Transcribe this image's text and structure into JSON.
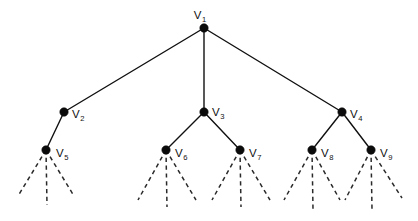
{
  "figure": {
    "kind": "rooted-tree-diagram",
    "title": "",
    "width": 418,
    "height": 221,
    "background_color": "#ffffff",
    "line_color": "#101010",
    "node_color": "#0b0b0b"
  },
  "chart_data": {
    "type": "diagram",
    "title": "",
    "xlabel": "",
    "ylabel": "",
    "nodes": [
      {
        "id": "V1",
        "label": "V",
        "subscript": "1",
        "x": 204,
        "y": 28,
        "label_x": 200,
        "label_y": 19,
        "label_anchor": "middle",
        "level": 0
      },
      {
        "id": "V2",
        "label": "V",
        "subscript": "2",
        "x": 64,
        "y": 112,
        "label_x": 72,
        "label_y": 118,
        "label_anchor": "start",
        "level": 1
      },
      {
        "id": "V3",
        "label": "V",
        "subscript": "3",
        "x": 204,
        "y": 112,
        "label_x": 212,
        "label_y": 116,
        "label_anchor": "start",
        "level": 1
      },
      {
        "id": "V4",
        "label": "V",
        "subscript": "4",
        "x": 342,
        "y": 112,
        "label_x": 350,
        "label_y": 118,
        "label_anchor": "start",
        "level": 1
      },
      {
        "id": "V5",
        "label": "V",
        "subscript": "5",
        "x": 46,
        "y": 150,
        "label_x": 56,
        "label_y": 157,
        "label_anchor": "start",
        "level": 2
      },
      {
        "id": "V6",
        "label": "V",
        "subscript": "6",
        "x": 166,
        "y": 150,
        "label_x": 175,
        "label_y": 157,
        "label_anchor": "start",
        "level": 2
      },
      {
        "id": "V7",
        "label": "V",
        "subscript": "7",
        "x": 240,
        "y": 150,
        "label_x": 249,
        "label_y": 157,
        "label_anchor": "start",
        "level": 2
      },
      {
        "id": "V8",
        "label": "V",
        "subscript": "8",
        "x": 312,
        "y": 150,
        "label_x": 321,
        "label_y": 157,
        "label_anchor": "start",
        "level": 2
      },
      {
        "id": "V9",
        "label": "V",
        "subscript": "9",
        "x": 371,
        "y": 150,
        "label_x": 380,
        "label_y": 157,
        "label_anchor": "start",
        "level": 2
      }
    ],
    "edges": [
      {
        "from": "V1",
        "to": "V2",
        "style": "solid"
      },
      {
        "from": "V1",
        "to": "V3",
        "style": "solid"
      },
      {
        "from": "V1",
        "to": "V4",
        "style": "solid"
      },
      {
        "from": "V2",
        "to": "V5",
        "style": "solid"
      },
      {
        "from": "V3",
        "to": "V6",
        "style": "solid"
      },
      {
        "from": "V3",
        "to": "V7",
        "style": "solid"
      },
      {
        "from": "V4",
        "to": "V8",
        "style": "solid"
      },
      {
        "from": "V4",
        "to": "V9",
        "style": "solid"
      }
    ],
    "dashed_stubs": [
      {
        "from": "V5",
        "x1": 46,
        "y1": 150,
        "x2": 18,
        "y2": 196
      },
      {
        "from": "V5",
        "x1": 46,
        "y1": 150,
        "x2": 47,
        "y2": 205
      },
      {
        "from": "V5",
        "x1": 46,
        "y1": 150,
        "x2": 74,
        "y2": 196
      },
      {
        "from": "V6",
        "x1": 166,
        "y1": 150,
        "x2": 138,
        "y2": 200
      },
      {
        "from": "V6",
        "x1": 166,
        "y1": 150,
        "x2": 167,
        "y2": 207
      },
      {
        "from": "V6",
        "x1": 166,
        "y1": 150,
        "x2": 196,
        "y2": 200
      },
      {
        "from": "V7",
        "x1": 240,
        "y1": 150,
        "x2": 212,
        "y2": 200
      },
      {
        "from": "V7",
        "x1": 240,
        "y1": 150,
        "x2": 241,
        "y2": 207
      },
      {
        "from": "V7",
        "x1": 240,
        "y1": 150,
        "x2": 270,
        "y2": 200
      },
      {
        "from": "V8",
        "x1": 312,
        "y1": 150,
        "x2": 284,
        "y2": 200
      },
      {
        "from": "V8",
        "x1": 312,
        "y1": 150,
        "x2": 313,
        "y2": 209
      },
      {
        "from": "V8",
        "x1": 312,
        "y1": 150,
        "x2": 340,
        "y2": 200
      },
      {
        "from": "V9",
        "x1": 371,
        "y1": 150,
        "x2": 345,
        "y2": 200
      },
      {
        "from": "V9",
        "x1": 371,
        "y1": 150,
        "x2": 372,
        "y2": 209
      },
      {
        "from": "V9",
        "x1": 371,
        "y1": 150,
        "x2": 402,
        "y2": 198
      }
    ],
    "node_radius": 4.2
  }
}
